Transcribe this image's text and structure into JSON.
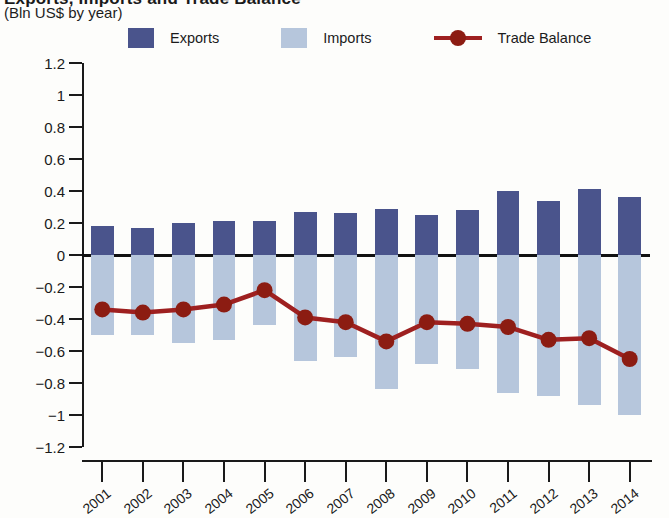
{
  "header": {
    "title_clipped": "Exports, Imports and Trade Balance",
    "subtitle": "(Bln US$ by year)"
  },
  "legend": {
    "position": "top",
    "items": [
      {
        "label": "Exports",
        "color": "#4a548c",
        "marker": "square"
      },
      {
        "label": "Imports",
        "color": "#b6c6dc",
        "marker": "square"
      },
      {
        "label": "Trade Balance",
        "color": "#8c1c12",
        "marker": "line-dot"
      }
    ]
  },
  "axes": {
    "y_ticks": [
      "1.2",
      "1",
      "0.8",
      "0.6",
      "0.4",
      "0.2",
      "0",
      "−0.2",
      "−0.4",
      "−0.6",
      "−0.8",
      "−1",
      "−1.2"
    ],
    "y_min": -1.2,
    "y_max": 1.2,
    "y_step": 0.2,
    "x_ticks": [
      "2001",
      "2002",
      "2003",
      "2004",
      "2005",
      "2006",
      "2007",
      "2008",
      "2009",
      "2010",
      "2011",
      "2012",
      "2013",
      "2014"
    ]
  },
  "colors": {
    "exports": "#4a548c",
    "imports": "#b6c6dc",
    "trade_balance": "#8c1c12",
    "trade_balance_line": "#9e2020",
    "axis": "#1a1a1a",
    "background": "#fdfdfb"
  },
  "chart_data": {
    "type": "bar",
    "title": "Exports, Imports and Trade Balance",
    "subtitle": "(Bln US$ by year)",
    "xlabel": "",
    "ylabel": "Bln US$",
    "ylim": [
      -1.2,
      1.2
    ],
    "ytick_step": 0.2,
    "grid": false,
    "legend_position": "top",
    "categories": [
      "2001",
      "2002",
      "2003",
      "2004",
      "2005",
      "2006",
      "2007",
      "2008",
      "2009",
      "2010",
      "2011",
      "2012",
      "2013",
      "2014"
    ],
    "series": [
      {
        "name": "Exports",
        "type": "bar",
        "color": "#4a548c",
        "values": [
          0.18,
          0.17,
          0.2,
          0.21,
          0.21,
          0.27,
          0.26,
          0.29,
          0.25,
          0.28,
          0.4,
          0.34,
          0.41,
          0.36
        ]
      },
      {
        "name": "Imports",
        "type": "bar",
        "color": "#b6c6dc",
        "values": [
          -0.5,
          -0.5,
          -0.55,
          -0.53,
          -0.44,
          -0.66,
          -0.64,
          -0.84,
          -0.68,
          -0.71,
          -0.86,
          -0.88,
          -0.94,
          -1.0
        ]
      },
      {
        "name": "Trade Balance",
        "type": "line",
        "color": "#8c1c12",
        "values": [
          -0.34,
          -0.36,
          -0.34,
          -0.31,
          -0.22,
          -0.39,
          -0.42,
          -0.54,
          -0.42,
          -0.43,
          -0.45,
          -0.53,
          -0.52,
          -0.65
        ]
      }
    ]
  }
}
